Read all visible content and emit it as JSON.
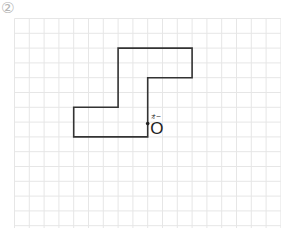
{
  "problem_number": "②",
  "grid": {
    "origin_x": 14.5,
    "origin_y": 18.5,
    "cell": 14.8,
    "cols": 18,
    "rows": 14,
    "line_color": "#e6e6e6"
  },
  "shape": {
    "stroke": "#333333",
    "vertices_grid": [
      [
        7,
        2
      ],
      [
        12,
        2
      ],
      [
        12,
        4
      ],
      [
        9,
        4
      ],
      [
        9,
        8
      ],
      [
        4,
        8
      ],
      [
        4,
        6
      ],
      [
        7,
        6
      ]
    ]
  },
  "point": {
    "name": "O",
    "furigana": "オー",
    "grid_x": 9,
    "grid_y": 7.1
  }
}
